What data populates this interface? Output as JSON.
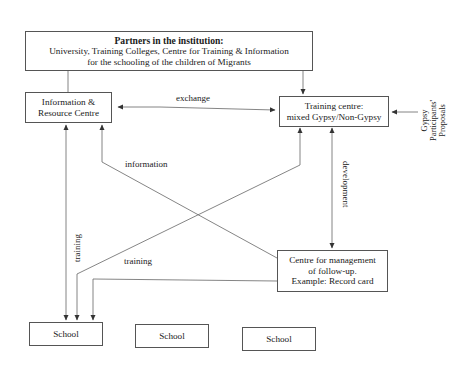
{
  "diagram": {
    "nodes": {
      "partners": {
        "title": "Partners in the institution:",
        "line1": "University, Training Colleges, Centre for Training & Information",
        "line2": "for the schooling of the children of Migrants"
      },
      "info_centre": {
        "line1": "Information &",
        "line2": "Resource Centre"
      },
      "training_centre": {
        "line1": "Training centre:",
        "line2": "mixed Gypsy/Non-Gypsy"
      },
      "management": {
        "line1": "Centre for management",
        "line2": "of follow-up.",
        "line3": "Example: Record card"
      },
      "schools": [
        {
          "label": "School"
        },
        {
          "label": "School"
        },
        {
          "label": "School"
        }
      ],
      "proposals": {
        "line1": "Gypsy",
        "line2": "Participants'",
        "line3": "Proposals"
      }
    },
    "edges": {
      "exchange": "exchange",
      "information": "information",
      "training_vertical": "training",
      "training_diagonal": "training",
      "development": "development"
    },
    "colors": {
      "line": "#555555",
      "text": "#1a1a1a",
      "background": "#ffffff"
    }
  }
}
